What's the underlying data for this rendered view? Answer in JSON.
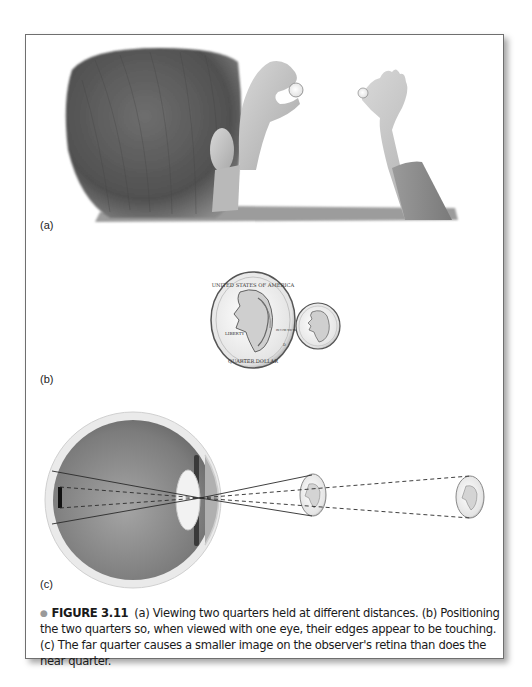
{
  "figure": {
    "number_label": "FIGURE 3.11",
    "bullet": "●",
    "caption_text": "(a) Viewing two quarters held at different distances. (b) Positioning the two quarters so, when viewed with one eye, their edges appear to be touching. (c) The far quarter causes a smaller image on the observer's retina than does the near quarter."
  },
  "panels": [
    {
      "id": "a",
      "label": "(a)",
      "description": "Back of a boy's head; one hand holds a near quarter, the other hand holds a far quarter at arm's length"
    },
    {
      "id": "b",
      "label": "(b)",
      "description": "Large near quarter and small far quarter appearing edge to edge"
    },
    {
      "id": "c",
      "label": "(c)",
      "description": "Cross-section of the eye with ray lines from near and far quarters converging through the lens onto the retina"
    }
  ],
  "coin": {
    "top_text": "UNITED STATES OF AMERICA",
    "left_text": "LIBERTY",
    "motto": "IN GOD WE TRUST",
    "bottom_text": "QUARTER DOLLAR",
    "mint_mark": "D"
  },
  "colors": {
    "frame_border": "#6f6f6f",
    "bullet": "#9a9a9a",
    "text": "#1a1a1a",
    "hair": "#5a5a5a",
    "skin": "#c8c8c8",
    "eye_interior": "#8a8a8a"
  }
}
